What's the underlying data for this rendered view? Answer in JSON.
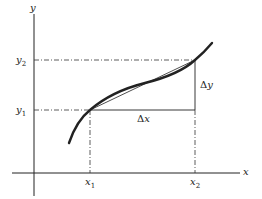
{
  "diagram": {
    "axes": {
      "x_label": "x",
      "y_label": "y"
    },
    "points": {
      "x1": {
        "name": "x",
        "sub": "1"
      },
      "x2": {
        "name": "x",
        "sub": "2"
      },
      "y1": {
        "name": "y",
        "sub": "1"
      },
      "y2": {
        "name": "y",
        "sub": "2"
      }
    },
    "increments": {
      "dx": {
        "delta": "Δ",
        "var": "x"
      },
      "dy": {
        "delta": "Δ",
        "var": "y"
      }
    },
    "colors": {
      "ink": "#222222",
      "background": "#ffffff"
    }
  }
}
